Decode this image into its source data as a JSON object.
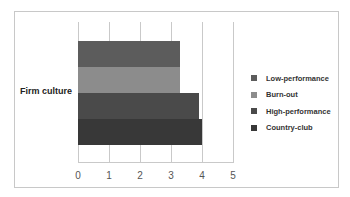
{
  "chart_data": {
    "type": "bar",
    "orientation": "horizontal",
    "title": "",
    "xlabel": "",
    "ylabel": "",
    "categories": [
      "Firm culture"
    ],
    "series": [
      {
        "name": "Low-performance",
        "values": [
          3.3
        ],
        "color": "#5c5c5c"
      },
      {
        "name": "Burn-out",
        "values": [
          3.3
        ],
        "color": "#8c8c8c"
      },
      {
        "name": "High-performance",
        "values": [
          3.9
        ],
        "color": "#4a4a4a"
      },
      {
        "name": "Country-club",
        "values": [
          4.0
        ],
        "color": "#383838"
      }
    ],
    "xlim": [
      0,
      5
    ],
    "xticks": [
      "0",
      "1",
      "2",
      "3",
      "4",
      "5"
    ],
    "grid": true,
    "legend_position": "right"
  }
}
